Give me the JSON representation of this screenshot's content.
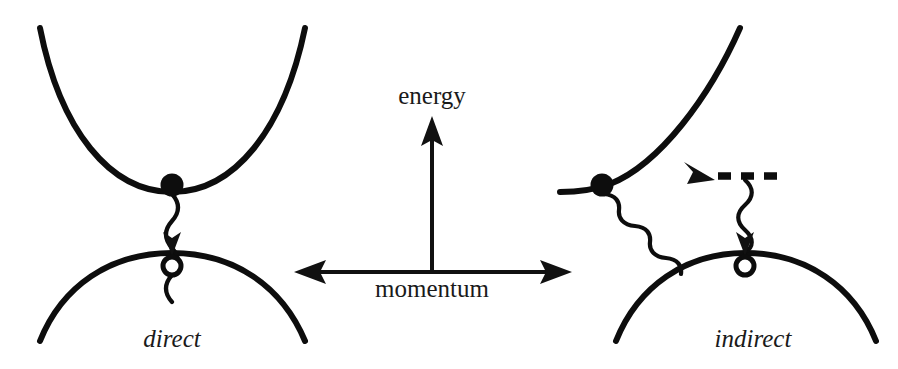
{
  "figure": {
    "background_color": "#ffffff",
    "ink_color": "#0d0d0d",
    "width": 898,
    "height": 369
  },
  "axes": {
    "vertical": {
      "label": "energy",
      "label_x": 432,
      "label_y": 106,
      "x": 432,
      "y_top": 118,
      "y_bottom": 272,
      "arrow": "up"
    },
    "horizontal": {
      "label": "momentum",
      "label_x": 432,
      "label_y": 298,
      "y": 272,
      "x_left": 296,
      "x_right": 570,
      "arrow": "both"
    }
  },
  "panels": [
    {
      "id": "direct",
      "label": "direct",
      "label_x": 172,
      "label_y": 344,
      "conduction_band": {
        "name": "conduction-band-curve",
        "path": "M 40 28 Q 75 190 172 192 Q 270 190 305 28"
      },
      "valence_band": {
        "name": "valence-band-curve",
        "path": "M 40 341 Q 75 255 172 253 Q 270 255 305 341"
      },
      "electron": {
        "name": "electron-dot",
        "cx": 172,
        "cy": 185,
        "r": 11.5
      },
      "hole": {
        "name": "hole-circle",
        "cx": 172,
        "cy": 266,
        "r": 9
      },
      "transition": {
        "type": "vertical-photon",
        "start_x": 172,
        "start_y": 196,
        "end_x": 172,
        "end_y": 250,
        "arrow": "down"
      }
    },
    {
      "id": "indirect",
      "label": "indirect",
      "label_x": 753,
      "label_y": 344,
      "conduction_band": {
        "name": "conduction-band-curve",
        "path": "M 560 192 Q 600 190 642 150 Q 700 75 740 28"
      },
      "valence_band": {
        "name": "valence-band-curve",
        "path": "M 616 341 Q 652 255 745 253 Q 840 255 876 341"
      },
      "electron": {
        "name": "electron-dot",
        "cx": 602,
        "cy": 185,
        "r": 11.5
      },
      "hole": {
        "name": "hole-circle",
        "cx": 745,
        "cy": 266,
        "r": 9
      },
      "phonon_level": {
        "name": "dashed-intermediate-level",
        "x1": 718,
        "x2": 782,
        "y": 176
      },
      "transition_photon": {
        "type": "diagonal-photon",
        "start_x": 606,
        "start_y": 196,
        "end_x": 712,
        "end_y": 172,
        "arrow": "down-right"
      },
      "transition_phonon": {
        "type": "vertical-photon",
        "start_x": 745,
        "start_y": 182,
        "end_x": 745,
        "end_y": 250,
        "arrow": "down"
      }
    }
  ]
}
